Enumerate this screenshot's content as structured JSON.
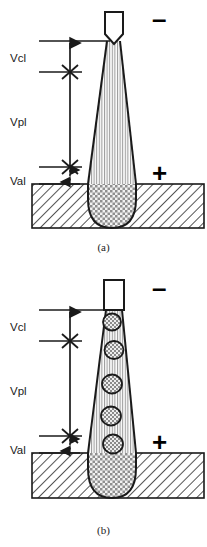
{
  "figure": {
    "type": "technical-schematic",
    "background_color": "#ffffff",
    "line_color": "#1a1a1a"
  },
  "panels": [
    {
      "id": "a",
      "caption": "(a)",
      "description": "Arc with pointed electrode tip, continuous arc column, no droplets",
      "electrode": {
        "polarity_sign": "–",
        "polarity_name": "negative",
        "tip_shape": "v-notch-pointed"
      },
      "workpiece": {
        "polarity_sign": "+",
        "polarity_name": "positive",
        "hatch": "diagonal-45"
      },
      "weld_pool": {
        "hatch": "cross-hatch",
        "shape": "u-shaped"
      },
      "arc_column": {
        "hatch": "vertical-lines"
      },
      "droplets": {
        "count": 0,
        "values": []
      },
      "dimensions": [
        {
          "label": "Vcl",
          "name": "cathode-layer-voltage-zone"
        },
        {
          "label": "Vpl",
          "name": "plasma-column-voltage-zone"
        },
        {
          "label": "Val",
          "name": "anode-layer-voltage-zone"
        }
      ]
    },
    {
      "id": "b",
      "caption": "(b)",
      "description": "Arc with flat electrode tip and five metal droplets in transfer",
      "electrode": {
        "polarity_sign": "–",
        "polarity_name": "negative",
        "tip_shape": "flat"
      },
      "workpiece": {
        "polarity_sign": "+",
        "polarity_name": "positive",
        "hatch": "diagonal-45"
      },
      "weld_pool": {
        "hatch": "cross-hatch",
        "shape": "u-shaped"
      },
      "arc_column": {
        "hatch": "vertical-lines"
      },
      "droplets": {
        "count": 5,
        "values": [
          1,
          2,
          3,
          4,
          5
        ]
      },
      "dimensions": [
        {
          "label": "Vcl",
          "name": "cathode-layer-voltage-zone"
        },
        {
          "label": "Vpl",
          "name": "plasma-column-voltage-zone"
        },
        {
          "label": "Val",
          "name": "anode-layer-voltage-zone"
        }
      ]
    }
  ]
}
